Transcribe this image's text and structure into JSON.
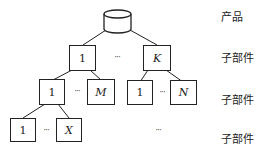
{
  "diagram": {
    "root": {
      "label": "",
      "shape": "cylinder"
    },
    "level1": [
      {
        "label": "1"
      },
      {
        "label": "K",
        "italic": true
      }
    ],
    "level2": [
      {
        "label": "1"
      },
      {
        "label": "M",
        "italic": true
      },
      {
        "label": "1"
      },
      {
        "label": "N",
        "italic": true
      }
    ],
    "level3": [
      {
        "label": "1"
      },
      {
        "label": "X",
        "italic": true
      }
    ],
    "ellipsis": "···",
    "level_labels": [
      "产品",
      "子部件",
      "子部件",
      "子部件"
    ]
  }
}
